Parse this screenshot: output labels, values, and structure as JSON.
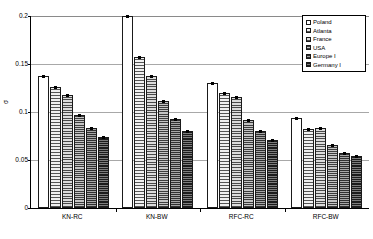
{
  "chart_data": {
    "type": "bar",
    "title": "",
    "xlabel": "",
    "ylabel": "σ",
    "ylim": [
      0,
      0.2
    ],
    "yticks": [
      "0",
      "0.05",
      "0.1",
      "0.15",
      "0.2"
    ],
    "ytick_values": [
      0,
      0.05,
      0.1,
      0.15,
      0.2
    ],
    "grid": true,
    "legend_position": "top-right",
    "categories": [
      "KN-RC",
      "KN-BW",
      "RFC-RC",
      "RFC-BW"
    ],
    "series": [
      {
        "name": "Poland",
        "values": [
          0.1375,
          0.2,
          0.13,
          0.0935
        ]
      },
      {
        "name": "Atlanta",
        "values": [
          0.126,
          0.157,
          0.12,
          0.0825
        ]
      },
      {
        "name": "France",
        "values": [
          0.118,
          0.1375,
          0.1155,
          0.0835
        ]
      },
      {
        "name": "USA",
        "values": [
          0.097,
          0.111,
          0.0915,
          0.0655
        ]
      },
      {
        "name": "Europe I",
        "values": [
          0.0835,
          0.0925,
          0.0805,
          0.0575
        ]
      },
      {
        "name": "Germany I",
        "values": [
          0.0735,
          0.08,
          0.0705,
          0.0545
        ]
      }
    ]
  },
  "legend": {
    "items": [
      {
        "label": "Poland"
      },
      {
        "label": "Atlanta"
      },
      {
        "label": "France"
      },
      {
        "label": "USA"
      },
      {
        "label": "Europe I"
      },
      {
        "label": "Germany I"
      }
    ]
  },
  "axes": {
    "y_title": "σ",
    "y_ticks": [
      {
        "label": "0.2"
      },
      {
        "label": "0.15"
      },
      {
        "label": "0.1"
      },
      {
        "label": "0.05"
      },
      {
        "label": "0"
      }
    ],
    "x_ticks": [
      {
        "label": "KN-RC"
      },
      {
        "label": "KN-BW"
      },
      {
        "label": "RFC-RC"
      },
      {
        "label": "RFC-BW"
      }
    ]
  }
}
